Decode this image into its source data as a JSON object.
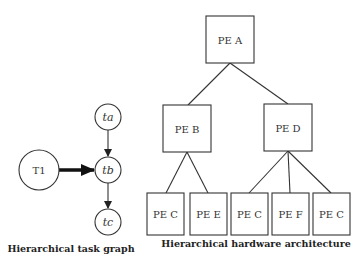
{
  "task_graph": {
    "caption": "Hierarchical task graph",
    "nodes": [
      {
        "id": "T1",
        "label": "T1",
        "italic": false
      },
      {
        "id": "ta",
        "label": "ta",
        "italic": true
      },
      {
        "id": "tb",
        "label": "tb",
        "italic": true
      },
      {
        "id": "tc",
        "label": "tc",
        "italic": true
      }
    ],
    "edges": [
      {
        "from": "ta",
        "to": "tb"
      },
      {
        "from": "T1",
        "to": "tb",
        "style": "thick"
      },
      {
        "from": "tb",
        "to": "tc"
      }
    ]
  },
  "hardware_architecture": {
    "caption": "Hierarchical hardware architecture",
    "nodes": [
      {
        "id": "A",
        "label": "PE A",
        "level": 0
      },
      {
        "id": "B",
        "label": "PE B",
        "level": 1
      },
      {
        "id": "D",
        "label": "PE D",
        "level": 1
      },
      {
        "id": "C1",
        "label": "PE C",
        "level": 2
      },
      {
        "id": "E",
        "label": "PE E",
        "level": 2
      },
      {
        "id": "C2",
        "label": "PE C",
        "level": 2
      },
      {
        "id": "F",
        "label": "PE F",
        "level": 2
      },
      {
        "id": "C3",
        "label": "PE C",
        "level": 2
      }
    ],
    "edges": [
      {
        "from": "A",
        "to": "B"
      },
      {
        "from": "A",
        "to": "D"
      },
      {
        "from": "B",
        "to": "C1"
      },
      {
        "from": "B",
        "to": "E"
      },
      {
        "from": "D",
        "to": "C2"
      },
      {
        "from": "D",
        "to": "F"
      },
      {
        "from": "D",
        "to": "C3"
      }
    ]
  }
}
